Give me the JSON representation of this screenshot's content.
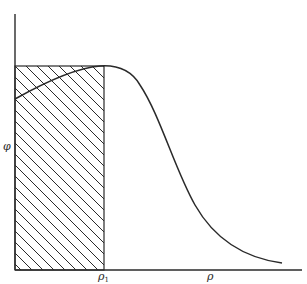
{
  "chart_data": {
    "type": "line",
    "title": "",
    "xlabel": "ρ",
    "ylabel": "φ",
    "x_tick_labels": [
      {
        "label": "ρ",
        "sub": "1",
        "x_norm": 0.31
      }
    ],
    "grid": false,
    "legend": null,
    "series": [
      {
        "name": "φ(ρ)",
        "x": [
          0.0,
          0.1,
          0.2,
          0.31,
          0.36,
          0.45,
          0.55,
          0.65,
          0.75,
          0.85,
          0.93
        ],
        "y": [
          0.84,
          0.88,
          0.92,
          0.95,
          0.94,
          0.8,
          0.55,
          0.3,
          0.14,
          0.06,
          0.04
        ]
      }
    ],
    "annotations": [
      {
        "type": "hatched_rectangle",
        "x0": 0.0,
        "x1": 0.31,
        "y0": 0.0,
        "y1": 0.95,
        "hatch": "diagonal ↘"
      }
    ],
    "xlim": [
      0,
      1
    ],
    "ylim": [
      0,
      1
    ]
  },
  "labels": {
    "y_axis": "φ",
    "x_axis": "ρ",
    "rho1_main": "ρ",
    "rho1_sub": "1"
  },
  "colors": {
    "ink": "#2a2a2a",
    "background": "#ffffff"
  }
}
